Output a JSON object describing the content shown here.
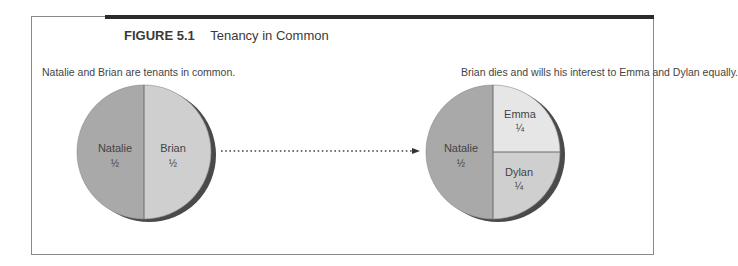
{
  "figure": {
    "number": "FIGURE 5.1",
    "title": "Tenancy in Common"
  },
  "left_panel": {
    "caption": "Natalie and Brian are tenants in common.",
    "pie": [
      {
        "owner": "Natalie",
        "share": "½",
        "fraction": 0.5,
        "color": "#a9a9a9"
      },
      {
        "owner": "Brian",
        "share": "½",
        "fraction": 0.5,
        "color": "#cfcfcf"
      }
    ]
  },
  "right_panel": {
    "caption": "Brian dies and wills his interest to Emma and Dylan equally.",
    "pie": [
      {
        "owner": "Natalie",
        "share": "½",
        "fraction": 0.5,
        "color": "#a9a9a9"
      },
      {
        "owner": "Emma",
        "share": "¼",
        "fraction": 0.25,
        "color": "#e6e6e6"
      },
      {
        "owner": "Dylan",
        "share": "¼",
        "fraction": 0.25,
        "color": "#cfcfcf"
      }
    ]
  },
  "arrow": {
    "style": "dotted",
    "direction": "right"
  },
  "colors": {
    "frame_bar": "#2b2b2b",
    "frame_line": "#8a8a8a",
    "pie_shadow": "#4a4a4a",
    "divider": "#6a6a6a"
  }
}
